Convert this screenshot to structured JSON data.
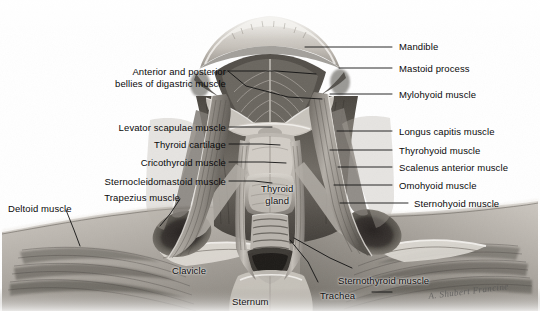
{
  "figure": {
    "kind": "anatomical-illustration",
    "palette": {
      "background": "#ffffff",
      "label_text": "#0a0a0a",
      "leader_line": "#1a1a1a",
      "tissue_light": "#d8d4cf",
      "tissue_mid": "#a7a29b",
      "tissue_dark": "#6d6861",
      "tissue_deep": "#3c3833",
      "shadow": "#2a2724"
    },
    "signature": "A. Shubert Francine"
  },
  "labels_left": [
    {
      "id": "digastric",
      "text_lines": [
        "Anterior and posterior",
        "bellies of digastric muscle"
      ],
      "x": 66,
      "y": 66,
      "width": 160,
      "align": "right"
    },
    {
      "id": "levator-scapulae",
      "text_lines": [
        "Levator scapulae muscle"
      ],
      "x": 82,
      "y": 122,
      "width": 144,
      "align": "right"
    },
    {
      "id": "thyroid-cartilage",
      "text_lines": [
        "Thyroid cartilage"
      ],
      "x": 118,
      "y": 139,
      "width": 108,
      "align": "right"
    },
    {
      "id": "cricothyroid",
      "text_lines": [
        "Cricothyroid muscle"
      ],
      "x": 104,
      "y": 157,
      "width": 122,
      "align": "right"
    },
    {
      "id": "sternocleidomastoid",
      "text_lines": [
        "Sternocleidomastoid muscle"
      ],
      "x": 40,
      "y": 176,
      "width": 186,
      "align": "right"
    },
    {
      "id": "trapezius",
      "text_lines": [
        "Trapezius muscle"
      ],
      "x": 70,
      "y": 192,
      "width": 110,
      "align": "right"
    },
    {
      "id": "deltoid",
      "text_lines": [
        "Deltoid muscle"
      ],
      "x": 8,
      "y": 203,
      "width": 95,
      "align": "left"
    }
  ],
  "labels_right": [
    {
      "id": "mandible",
      "text_lines": [
        "Mandible"
      ],
      "x": 399,
      "y": 41
    },
    {
      "id": "mastoid-process",
      "text_lines": [
        "Mastoid process"
      ],
      "x": 399,
      "y": 63
    },
    {
      "id": "mylohyoid",
      "text_lines": [
        "Mylohyoid muscle"
      ],
      "x": 399,
      "y": 89
    },
    {
      "id": "longus-capitis",
      "text_lines": [
        "Longus capitis muscle"
      ],
      "x": 399,
      "y": 126
    },
    {
      "id": "thyrohyoid",
      "text_lines": [
        "Thyrohyoid muscle"
      ],
      "x": 399,
      "y": 145
    },
    {
      "id": "scalenus-anterior",
      "text_lines": [
        "Scalenus anterior muscle"
      ],
      "x": 399,
      "y": 162
    },
    {
      "id": "omohyoid",
      "text_lines": [
        "Omohyoid muscle"
      ],
      "x": 399,
      "y": 180
    },
    {
      "id": "sternohyoid",
      "text_lines": [
        "Sternohyoid muscle"
      ],
      "x": 414,
      "y": 198
    }
  ],
  "labels_on_art": [
    {
      "id": "thyroid-gland",
      "text_lines": [
        "Thyroid",
        "gland"
      ],
      "x": 261,
      "y": 183
    },
    {
      "id": "clavicle",
      "text_lines": [
        "Clavicle"
      ],
      "x": 172,
      "y": 265
    },
    {
      "id": "sternum",
      "text_lines": [
        "Sternum"
      ],
      "x": 232,
      "y": 296
    },
    {
      "id": "sternothyroid",
      "text_lines": [
        "Sternothyroid muscle"
      ],
      "x": 338,
      "y": 275
    },
    {
      "id": "trachea",
      "text_lines": [
        "Trachea"
      ],
      "x": 320,
      "y": 290
    }
  ],
  "leaders": [
    {
      "id": "leader-digastric-1",
      "points": "228,71 276,71 316,74"
    },
    {
      "id": "leader-digastric-2",
      "points": "228,71 246,86 288,97 322,99"
    },
    {
      "id": "leader-levator-scapulae",
      "points": "229,127 258,127 272,127"
    },
    {
      "id": "leader-thyroid-cartilage",
      "points": "229,144 262,144 280,145"
    },
    {
      "id": "leader-cricothyroid",
      "points": "229,162 264,162 286,163"
    },
    {
      "id": "leader-sternocleidomastoid",
      "points": "229,181 254,181 272,183"
    },
    {
      "id": "leader-trapezius",
      "points": "180,199 170,214 160,226"
    },
    {
      "id": "leader-deltoid",
      "points": "66,210 74,230 80,246"
    },
    {
      "id": "leader-mandible",
      "points": "305,47 330,47 352,47 392,47"
    },
    {
      "id": "leader-mastoid",
      "points": "339,68 368,68 392,68"
    },
    {
      "id": "leader-mylohyoid",
      "points": "330,94 360,94 392,94"
    },
    {
      "id": "leader-longus-capitis",
      "points": "337,131 364,131 392,131"
    },
    {
      "id": "leader-thyrohyoid",
      "points": "330,150 362,150 392,150"
    },
    {
      "id": "leader-scalenus",
      "points": "338,167 366,167 392,167"
    },
    {
      "id": "leader-omohyoid",
      "points": "334,185 364,185 392,185"
    },
    {
      "id": "leader-sternohyoid",
      "points": "340,203 376,203 408,203"
    },
    {
      "id": "leader-sternothyroid",
      "points": "294,238 330,258 352,268"
    },
    {
      "id": "leader-trachea",
      "points": "290,240 308,262 318,282"
    },
    {
      "id": "leader-trachea-tick",
      "points": "372,292 392,292"
    }
  ]
}
